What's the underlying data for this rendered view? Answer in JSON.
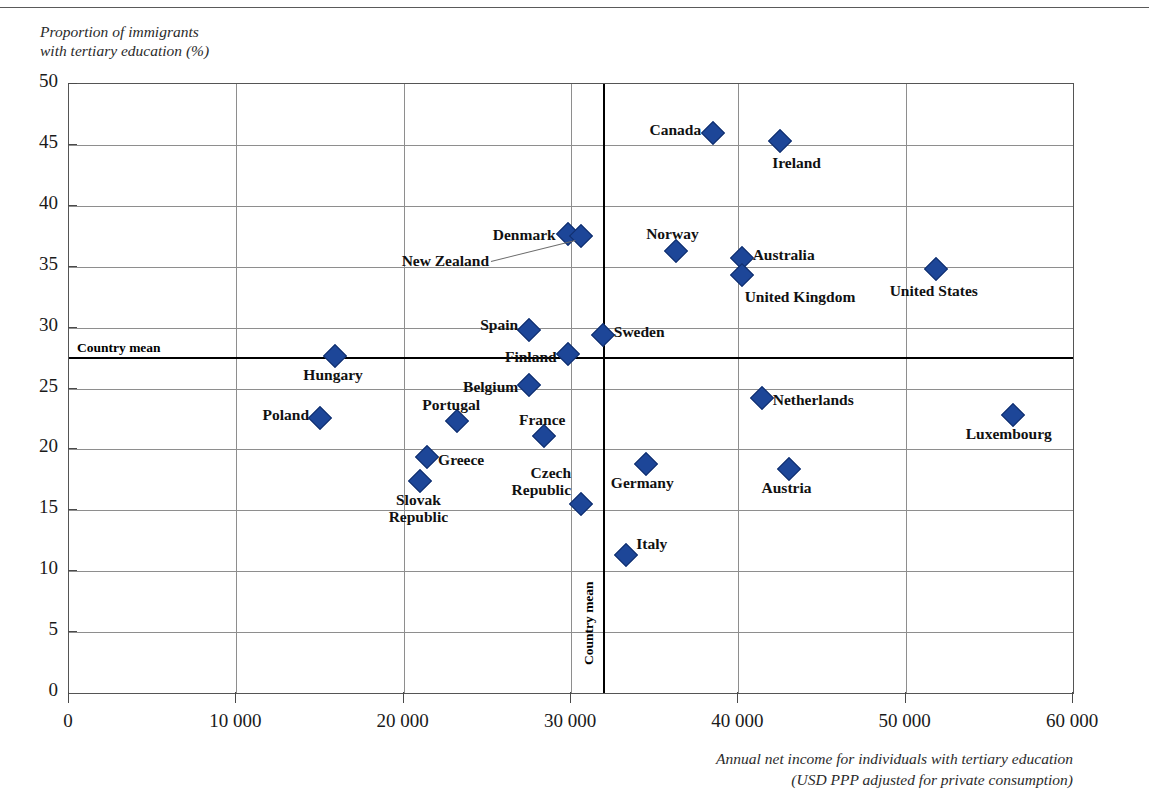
{
  "axis": {
    "ylabel": "Proportion of immigrants\nwith tertiary education (%)",
    "xlabel": "Annual net income for individuals with tertiary education\n(USD PPP adjusted for private consumption)",
    "yticks": [
      "0",
      "5",
      "10",
      "15",
      "20",
      "25",
      "30",
      "35",
      "40",
      "45",
      "50"
    ],
    "xticks": [
      "0",
      "10 000",
      "20 000",
      "30 000",
      "40 000",
      "50 000",
      "60 000"
    ]
  },
  "mean_lines": {
    "horizontal_label": "Country mean",
    "vertical_label": "Country mean",
    "horizontal_value": 27.6,
    "vertical_value": 31900
  },
  "colors": {
    "marker": "#1d4698",
    "marker_edge": "#122f6d",
    "grid": "#8e8e8e",
    "axis": "#555555",
    "mean_line": "#000000"
  },
  "chart_data": {
    "type": "scatter",
    "title": "",
    "xlabel": "Annual net income for individuals with tertiary education (USD PPP adjusted for private consumption)",
    "ylabel": "Proportion of immigrants with tertiary education (%)",
    "xlim": [
      0,
      60000
    ],
    "ylim": [
      0,
      50
    ],
    "xtick_step": 10000,
    "ytick_step": 5,
    "grid": true,
    "legend": "none",
    "reference_lines": [
      {
        "orientation": "horizontal",
        "value": 27.6,
        "label": "Country mean"
      },
      {
        "orientation": "vertical",
        "value": 31900,
        "label": "Country mean"
      }
    ],
    "points": [
      {
        "label": "Canada",
        "x": 38500,
        "y": 46.0,
        "label_pos": "left"
      },
      {
        "label": "Ireland",
        "x": 42500,
        "y": 45.3,
        "label_pos": "below-left"
      },
      {
        "label": "Denmark",
        "x": 29800,
        "y": 37.7,
        "label_pos": "left"
      },
      {
        "label": "New Zealand",
        "x": 30600,
        "y": 37.5,
        "label_pos": "leader-left"
      },
      {
        "label": "Norway",
        "x": 36300,
        "y": 36.3,
        "label_pos": "above"
      },
      {
        "label": "Australia",
        "x": 40200,
        "y": 35.7,
        "label_pos": "right"
      },
      {
        "label": "United Kingdom",
        "x": 40200,
        "y": 34.3,
        "label_pos": "below-right"
      },
      {
        "label": "United States",
        "x": 51800,
        "y": 34.8,
        "label_pos": "below"
      },
      {
        "label": "Spain",
        "x": 27500,
        "y": 29.8,
        "label_pos": "above-left"
      },
      {
        "label": "Sweden",
        "x": 31900,
        "y": 29.4,
        "label_pos": "above-right"
      },
      {
        "label": "Finland",
        "x": 29800,
        "y": 27.8,
        "label_pos": "left"
      },
      {
        "label": "Hungary",
        "x": 15900,
        "y": 27.7,
        "label_pos": "below"
      },
      {
        "label": "Belgium",
        "x": 27500,
        "y": 25.3,
        "label_pos": "left"
      },
      {
        "label": "Netherlands",
        "x": 41400,
        "y": 24.2,
        "label_pos": "right"
      },
      {
        "label": "Poland",
        "x": 15000,
        "y": 22.6,
        "label_pos": "above-left"
      },
      {
        "label": "Luxembourg",
        "x": 56400,
        "y": 22.8,
        "label_pos": "below-left"
      },
      {
        "label": "Portugal",
        "x": 23200,
        "y": 22.3,
        "label_pos": "above-left"
      },
      {
        "label": "France",
        "x": 28400,
        "y": 21.1,
        "label_pos": "above-left"
      },
      {
        "label": "Greece",
        "x": 21400,
        "y": 19.4,
        "label_pos": "right"
      },
      {
        "label": "Germany",
        "x": 34500,
        "y": 18.8,
        "label_pos": "below"
      },
      {
        "label": "Austria",
        "x": 43000,
        "y": 18.4,
        "label_pos": "below"
      },
      {
        "label": "Slovak Republic",
        "x": 21000,
        "y": 17.4,
        "label_pos": "below"
      },
      {
        "label": "Czech Republic",
        "x": 30600,
        "y": 15.5,
        "label_pos": "above-left"
      },
      {
        "label": "Italy",
        "x": 33300,
        "y": 11.3,
        "label_pos": "above-right"
      }
    ]
  }
}
